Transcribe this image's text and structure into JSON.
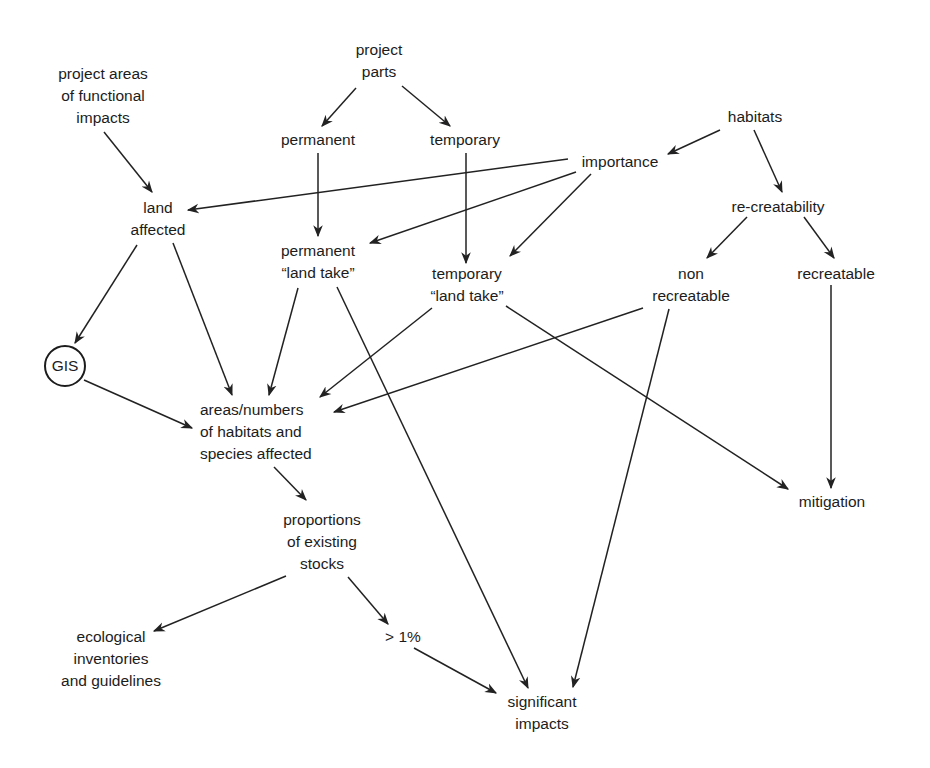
{
  "diagram": {
    "type": "flowchart",
    "nodes": {
      "project_areas": "project areas\nof functional\nimpacts",
      "project_parts": "project\nparts",
      "permanent": "permanent",
      "temporary": "temporary",
      "habitats": "habitats",
      "importance": "importance",
      "land_affected": "land\naffected",
      "re_creatability": "re-creatability",
      "permanent_land_take": "permanent\n“land take”",
      "temporary_land_take": "temporary\n“land take”",
      "non_recreatable": "non\nrecreatable",
      "recreatable": "recreatable",
      "gis": "GIS",
      "areas_numbers": "areas/numbers\nof habitats and\nspecies affected",
      "mitigation": "mitigation",
      "proportions": "proportions\nof existing\nstocks",
      "ecological": "ecological\ninventories\nand guidelines",
      "gt1": "> 1%",
      "significant": "significant\nimpacts"
    },
    "edges": [
      {
        "from": "project_parts",
        "to": "permanent"
      },
      {
        "from": "project_parts",
        "to": "temporary"
      },
      {
        "from": "project_areas",
        "to": "land_affected"
      },
      {
        "from": "habitats",
        "to": "importance"
      },
      {
        "from": "habitats",
        "to": "re_creatability"
      },
      {
        "from": "importance",
        "to": "land_affected"
      },
      {
        "from": "importance",
        "to": "permanent_land_take"
      },
      {
        "from": "importance",
        "to": "temporary_land_take"
      },
      {
        "from": "permanent",
        "to": "permanent_land_take"
      },
      {
        "from": "temporary",
        "to": "temporary_land_take"
      },
      {
        "from": "re_creatability",
        "to": "non_recreatable"
      },
      {
        "from": "re_creatability",
        "to": "recreatable"
      },
      {
        "from": "land_affected",
        "to": "gis"
      },
      {
        "from": "land_affected",
        "to": "areas_numbers"
      },
      {
        "from": "gis",
        "to": "areas_numbers"
      },
      {
        "from": "permanent_land_take",
        "to": "areas_numbers"
      },
      {
        "from": "temporary_land_take",
        "to": "areas_numbers"
      },
      {
        "from": "non_recreatable",
        "to": "areas_numbers"
      },
      {
        "from": "permanent_land_take",
        "to": "significant"
      },
      {
        "from": "temporary_land_take",
        "to": "mitigation"
      },
      {
        "from": "non_recreatable",
        "to": "significant"
      },
      {
        "from": "recreatable",
        "to": "mitigation"
      },
      {
        "from": "areas_numbers",
        "to": "proportions"
      },
      {
        "from": "proportions",
        "to": "ecological"
      },
      {
        "from": "proportions",
        "to": "gt1"
      },
      {
        "from": "gt1",
        "to": "significant"
      }
    ]
  }
}
